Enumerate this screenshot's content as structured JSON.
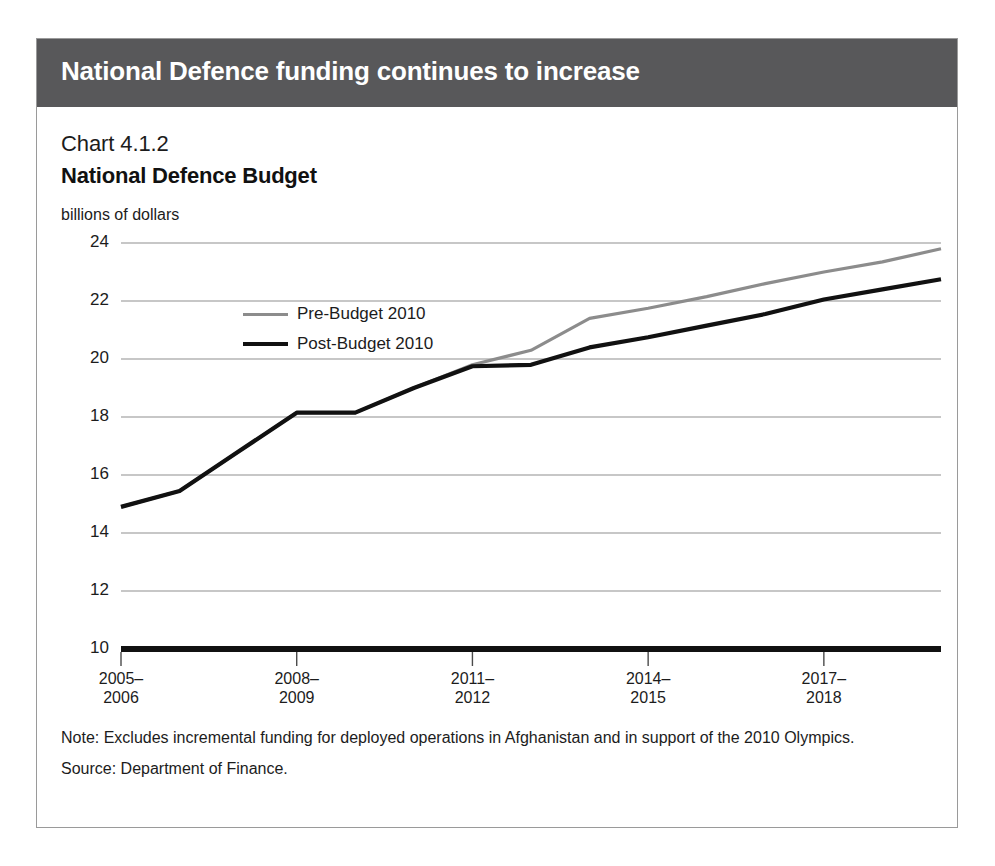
{
  "header": {
    "title": "National Defence funding continues to increase",
    "bar_color": "#58585a"
  },
  "chart_number": "Chart 4.1.2",
  "chart_title": "National Defence Budget",
  "axis_units": "billions of dollars",
  "legend": {
    "items": [
      {
        "label": "Pre-Budget 2010",
        "color": "#8c8c8c"
      },
      {
        "label": "Post-Budget 2010",
        "color": "#111111"
      }
    ]
  },
  "notes": {
    "note": "Note: Excludes incremental funding for deployed operations in Afghanistan and in support of the 2010 Olympics.",
    "source": "Source: Department of Finance."
  },
  "chart_data": {
    "type": "line",
    "title": "National Defence Budget",
    "subtitle": "Chart 4.1.2",
    "xlabel": "",
    "ylabel": "billions of dollars",
    "ylim": [
      10,
      24
    ],
    "yticks": [
      10,
      12,
      14,
      16,
      18,
      20,
      22,
      24
    ],
    "grid": true,
    "legend_position": "inside-upper-left",
    "x": [
      "2005-2006",
      "2006-2007",
      "2007-2008",
      "2008-2009",
      "2009-2010",
      "2010-2011",
      "2011-2012",
      "2012-2013",
      "2013-2014",
      "2014-2015",
      "2015-2016",
      "2016-2017",
      "2017-2018",
      "2018-2019",
      "2019-2020"
    ],
    "xtick_labels": [
      "2005–\n2006",
      "2008–\n2009",
      "2011–\n2012",
      "2014–\n2015",
      "2017–\n2018"
    ],
    "xticks_at": [
      "2005-2006",
      "2008-2009",
      "2011-2012",
      "2014-2015",
      "2017-2018"
    ],
    "series": [
      {
        "name": "Pre-Budget 2010",
        "color": "#8c8c8c",
        "values": [
          14.9,
          15.45,
          16.8,
          18.15,
          18.15,
          19.0,
          19.8,
          20.3,
          21.4,
          21.75,
          22.15,
          22.6,
          23.0,
          23.35,
          23.8
        ]
      },
      {
        "name": "Post-Budget 2010",
        "color": "#111111",
        "values": [
          14.9,
          15.45,
          16.8,
          18.15,
          18.15,
          19.0,
          19.75,
          19.8,
          20.4,
          20.75,
          21.15,
          21.55,
          22.05,
          22.4,
          22.75
        ]
      }
    ]
  },
  "plot_geometry": {
    "left": 84,
    "top": 204,
    "width": 820,
    "height": 406
  }
}
